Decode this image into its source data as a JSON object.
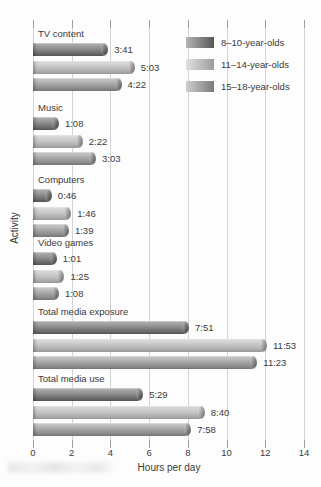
{
  "chart_data": {
    "type": "bar",
    "orientation": "horizontal",
    "title": "",
    "xlabel": "Hours per day",
    "ylabel": "Activity",
    "xlim": [
      0,
      14
    ],
    "xticks": [
      0,
      2,
      4,
      6,
      8,
      10,
      12,
      14
    ],
    "grid": true,
    "legend_position": "top-right",
    "categories": [
      "TV content",
      "Music",
      "Computers",
      "Video games",
      "Total media exposure",
      "Total media use"
    ],
    "series": [
      {
        "name": "8–10-year-olds",
        "labels": [
          "3:41",
          "1:08",
          "0:46",
          "1:01",
          "7:51",
          "5:29"
        ],
        "values_hours": [
          3.683,
          1.133,
          0.767,
          1.017,
          7.85,
          5.483
        ],
        "color_light": "#b5b5b5",
        "color_mid": "#8d8d8d",
        "color_dark": "#575757"
      },
      {
        "name": "11–14-year-olds",
        "labels": [
          "5:03",
          "2:22",
          "1:46",
          "1:25",
          "11:53",
          "8:40"
        ],
        "values_hours": [
          5.05,
          2.367,
          1.767,
          1.417,
          11.883,
          8.667
        ],
        "color_light": "#e0e0e0",
        "color_mid": "#c6c6c6",
        "color_dark": "#9d9d9d"
      },
      {
        "name": "15–18-year-olds",
        "labels": [
          "4:22",
          "3:03",
          "1:39",
          "1:08",
          "11:23",
          "7:58"
        ],
        "values_hours": [
          4.367,
          3.05,
          1.65,
          1.133,
          11.383,
          7.967
        ],
        "color_light": "#cecece",
        "color_mid": "#a8a8a8",
        "color_dark": "#7a7a7a"
      }
    ]
  }
}
